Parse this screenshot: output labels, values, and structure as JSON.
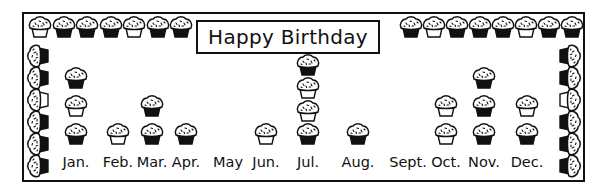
{
  "title": "Happy Birthday",
  "chart_data": {
    "type": "pictograph",
    "title": "Happy Birthday",
    "unit_icon": "cupcake",
    "unit_value": 1,
    "categories": [
      "Jan.",
      "Feb.",
      "Mar.",
      "Apr.",
      "May",
      "Jun.",
      "Jul.",
      "Aug.",
      "Sept.",
      "Oct.",
      "Nov.",
      "Dec."
    ],
    "values": [
      3,
      1,
      2,
      1,
      0,
      1,
      4,
      1,
      0,
      2,
      3,
      2
    ],
    "xlabel": "",
    "ylabel": "",
    "grid": false,
    "legend": null
  },
  "colors": {
    "ink": "#111111",
    "paper": "#ffffff"
  }
}
